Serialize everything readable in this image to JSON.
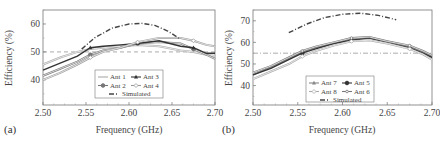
{
  "chart_data": [
    {
      "type": "line",
      "panel_label": "(a)",
      "xlabel": "Frequency (GHz)",
      "ylabel": "Efficiency (%)",
      "xlim": [
        2.5,
        2.7
      ],
      "ylim": [
        31,
        65
      ],
      "xticks": [
        "2.50",
        "2.55",
        "2.60",
        "2.65",
        "2.70"
      ],
      "yticks": [
        "40",
        "50",
        "60"
      ],
      "grid": false,
      "legend_position": "bottom-center",
      "reference_line": {
        "y": 50,
        "style": "dashed"
      },
      "x": [
        2.5,
        2.52,
        2.54,
        2.555,
        2.57,
        2.59,
        2.61,
        2.635,
        2.66,
        2.675,
        2.69,
        2.7
      ],
      "series": [
        {
          "name": "Ant 1",
          "marker": "none",
          "color": "#aaaaaa",
          "values": [
            45.5,
            48.0,
            50.0,
            51.0,
            51.5,
            52.0,
            52.5,
            52.0,
            50.5,
            50.0,
            49.0,
            48.5
          ]
        },
        {
          "name": "Ant 2",
          "marker": "circle",
          "color": "#777777",
          "values": [
            41.5,
            44.0,
            46.5,
            49.0,
            50.5,
            51.5,
            53.0,
            53.5,
            53.0,
            51.0,
            49.0,
            47.5
          ]
        },
        {
          "name": "Ant 3",
          "marker": "triangle",
          "color": "#333333",
          "values": [
            43.5,
            46.0,
            48.5,
            51.5,
            52.0,
            52.5,
            53.0,
            54.0,
            52.0,
            51.5,
            49.5,
            49.5
          ]
        },
        {
          "name": "Ant 4",
          "marker": "diamond-open",
          "color": "#999999",
          "values": [
            40.0,
            42.5,
            45.5,
            48.0,
            50.0,
            51.5,
            53.5,
            55.0,
            55.0,
            54.0,
            52.5,
            52.0
          ]
        },
        {
          "name": "Simulated",
          "marker": "none",
          "color": "#444444",
          "style": "dash-dot",
          "x": [
            2.545,
            2.56,
            2.58,
            2.6,
            2.615,
            2.63,
            2.645,
            2.66
          ],
          "values": [
            51.0,
            55.0,
            58.5,
            60.0,
            60.2,
            59.5,
            57.5,
            54.5
          ]
        }
      ]
    },
    {
      "type": "line",
      "panel_label": "(b)",
      "xlabel": "Frequency (GHz)",
      "ylabel": "Efficiency (%)",
      "xlim": [
        2.5,
        2.7
      ],
      "ylim": [
        31,
        75
      ],
      "xticks": [
        "2.50",
        "2.55",
        "2.60",
        "2.65",
        "2.70"
      ],
      "yticks": [
        "40",
        "50",
        "60",
        "70"
      ],
      "grid": false,
      "legend_position": "bottom-center",
      "reference_line": {
        "y": 55,
        "style": "dash-dot"
      },
      "x": [
        2.5,
        2.52,
        2.54,
        2.555,
        2.57,
        2.59,
        2.61,
        2.63,
        2.65,
        2.675,
        2.69,
        2.7
      ],
      "series": [
        {
          "name": "Ant 7",
          "marker": "triangle",
          "color": "#888888",
          "values": [
            45.0,
            48.5,
            52.5,
            55.5,
            57.5,
            59.5,
            61.5,
            62.0,
            60.5,
            58.0,
            55.5,
            53.5
          ]
        },
        {
          "name": "Ant 5",
          "marker": "circle",
          "color": "#333333",
          "values": [
            45.0,
            48.0,
            52.0,
            55.0,
            57.0,
            59.5,
            61.0,
            62.0,
            60.0,
            57.5,
            55.0,
            53.0
          ]
        },
        {
          "name": "Ant 8",
          "marker": "diamond-open",
          "color": "#aaaaaa",
          "values": [
            43.0,
            46.5,
            50.0,
            53.5,
            56.0,
            58.5,
            60.5,
            61.0,
            59.5,
            57.0,
            54.5,
            52.0
          ]
        },
        {
          "name": "Ant 6",
          "marker": "circle-small",
          "color": "#777777",
          "values": [
            46.0,
            49.0,
            53.0,
            56.0,
            58.0,
            60.0,
            62.0,
            62.5,
            60.5,
            58.5,
            56.0,
            54.0
          ]
        },
        {
          "name": "Simulated",
          "marker": "none",
          "color": "#444444",
          "style": "dash-dot",
          "x": [
            2.54,
            2.56,
            2.58,
            2.6,
            2.62,
            2.64,
            2.66
          ],
          "values": [
            64.5,
            68.5,
            71.5,
            73.0,
            73.5,
            72.5,
            70.5
          ]
        }
      ]
    }
  ],
  "legend_a": {
    "row1": [
      "Ant 1",
      "Ant 3"
    ],
    "row2": [
      "Ant 2",
      "Ant 4"
    ],
    "row3": [
      "Simulated"
    ]
  },
  "legend_b": {
    "row1": [
      "Ant 7",
      "Ant 5"
    ],
    "row2": [
      "Ant 8",
      "Ant 6"
    ],
    "row3": [
      "Simulated"
    ]
  }
}
